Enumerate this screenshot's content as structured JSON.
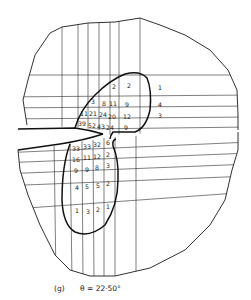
{
  "figure": {
    "caption_label": "(g)",
    "caption_equation": "θ = 22·50°"
  },
  "upper_zone_values": [
    {
      "text": "2"
    },
    {
      "text": "2"
    },
    {
      "text": "1"
    },
    {
      "text": "3"
    },
    {
      "text": "8"
    },
    {
      "text": "11"
    },
    {
      "text": "9"
    },
    {
      "text": "4"
    },
    {
      "text": "11"
    },
    {
      "text": "21"
    },
    {
      "text": "24"
    },
    {
      "text": "20"
    },
    {
      "text": "12"
    },
    {
      "text": "3"
    },
    {
      "text": "39"
    },
    {
      "text": "52"
    },
    {
      "text": "43"
    },
    {
      "text": "24"
    },
    {
      "text": "9"
    }
  ],
  "lower_zone_values": [
    {
      "text": "33"
    },
    {
      "text": "33"
    },
    {
      "text": "32"
    },
    {
      "text": "6"
    },
    {
      "text": "16"
    },
    {
      "text": "11"
    },
    {
      "text": "12"
    },
    {
      "text": "2"
    },
    {
      "text": "9"
    },
    {
      "text": "9"
    },
    {
      "text": "8"
    },
    {
      "text": "3"
    },
    {
      "text": "4"
    },
    {
      "text": "5"
    },
    {
      "text": "5"
    },
    {
      "text": "2"
    },
    {
      "text": "1"
    },
    {
      "text": "3"
    },
    {
      "text": "2"
    },
    {
      "text": "1"
    }
  ]
}
